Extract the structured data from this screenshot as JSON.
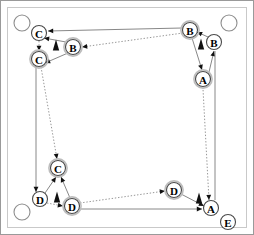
{
  "figure": {
    "width": 254,
    "height": 235,
    "background_color": "#ffffff",
    "frame": {
      "outer_color": "#9a9a9a",
      "inner_color": "#c9c9c9"
    }
  },
  "colors": {
    "node_stroke": "#4a4a4a",
    "node_halo": "#bdbdbd",
    "node_fill": "#ffffff",
    "corner_stroke": "#8d8d8d",
    "edge_solid": "#888888",
    "edge_dotted": "#8a8a8a",
    "arrow_fill": "#111111",
    "marker_fill": "#111111"
  },
  "corner_markers": [
    {
      "name": "corner-top-left",
      "label": "",
      "cx": 22,
      "cy": 23,
      "r": 8
    },
    {
      "name": "corner-top-right",
      "label": "",
      "cx": 229,
      "cy": 23,
      "r": 8
    },
    {
      "name": "corner-bottom-left",
      "label": "",
      "cx": 22,
      "cy": 212,
      "r": 8
    }
  ],
  "nodes": [
    {
      "id": "c-top",
      "label": "C",
      "cx": 39,
      "cy": 33,
      "r": 7.5,
      "halo": false
    },
    {
      "id": "b-top-inner",
      "label": "B",
      "cx": 73,
      "cy": 47,
      "r": 7.5,
      "halo": true
    },
    {
      "id": "c-upper-left",
      "label": "C",
      "cx": 39,
      "cy": 59,
      "r": 7.5,
      "halo": true
    },
    {
      "id": "b-top-right",
      "label": "B",
      "cx": 190,
      "cy": 30,
      "r": 7.5,
      "halo": true
    },
    {
      "id": "b-right",
      "label": "B",
      "cx": 214,
      "cy": 42,
      "r": 7.5,
      "halo": false
    },
    {
      "id": "a-right",
      "label": "A",
      "cx": 203,
      "cy": 79,
      "r": 7.5,
      "halo": true
    },
    {
      "id": "c-lower-left",
      "label": "C",
      "cx": 58,
      "cy": 168,
      "r": 7.5,
      "halo": true
    },
    {
      "id": "d-left",
      "label": "D",
      "cx": 40,
      "cy": 199,
      "r": 7.5,
      "halo": false
    },
    {
      "id": "d-inner",
      "label": "D",
      "cx": 72,
      "cy": 206,
      "r": 7.5,
      "halo": true
    },
    {
      "id": "d-right",
      "label": "D",
      "cx": 174,
      "cy": 190,
      "r": 7.5,
      "halo": true
    },
    {
      "id": "a-bottom",
      "label": "A",
      "cx": 211,
      "cy": 208,
      "r": 7.5,
      "halo": false
    },
    {
      "id": "e-bottom",
      "label": "E",
      "cx": 228,
      "cy": 222,
      "r": 7.5,
      "halo": false
    }
  ],
  "orientation_markers": [
    {
      "name": "marker-top-left",
      "cx": 56,
      "cy": 45,
      "size": 11,
      "rotation": 0
    },
    {
      "name": "marker-top-right",
      "cx": 201,
      "cy": 44,
      "size": 11,
      "rotation": 0
    },
    {
      "name": "marker-bottom-left",
      "cx": 57,
      "cy": 197,
      "size": 11,
      "rotation": 0
    },
    {
      "name": "marker-bottom-right",
      "cx": 199,
      "cy": 198,
      "size": 11,
      "rotation": 0
    }
  ],
  "edges": [
    {
      "name": "edge-b-top-right-to-c-top",
      "style": "solid",
      "from": "b-top-right",
      "to": "c-top",
      "x1": 182,
      "y1": 28,
      "x2": 48,
      "y2": 31,
      "arrow": "end"
    },
    {
      "name": "edge-b-right-to-b-top-right",
      "style": "solid",
      "from": "b-right",
      "to": "b-top-right",
      "x1": 208,
      "y1": 37,
      "x2": 197,
      "y2": 32,
      "arrow": "end"
    },
    {
      "name": "edge-b-top-right-to-a-right",
      "style": "solid",
      "from": "b-top-right",
      "to": "a-right",
      "x1": 192,
      "y1": 38,
      "x2": 202,
      "y2": 70,
      "arrow": "end"
    },
    {
      "name": "edge-a-right-to-b-right",
      "style": "solid",
      "from": "a-right",
      "to": "b-right",
      "x1": 209,
      "y1": 72,
      "x2": 214,
      "y2": 51,
      "arrow": "end"
    },
    {
      "name": "edge-b-inner-to-c-top",
      "style": "solid",
      "from": "b-top-inner",
      "to": "c-top",
      "x1": 66,
      "y1": 42,
      "x2": 44,
      "y2": 38,
      "arrow": "end"
    },
    {
      "name": "edge-b-top-right-to-b-inner",
      "style": "dotted",
      "from": "b-top-right",
      "to": "b-top-inner",
      "x1": 183,
      "y1": 33,
      "x2": 82,
      "y2": 47,
      "arrow": "end"
    },
    {
      "name": "edge-c-top-to-c-upper-left",
      "style": "dotted",
      "from": "c-top",
      "to": "c-upper-left",
      "x1": 39,
      "y1": 41,
      "x2": 39,
      "y2": 51,
      "arrow": "end"
    },
    {
      "name": "edge-b-inner-to-c-upper-left",
      "style": "solid",
      "from": "b-top-inner",
      "to": "c-upper-left",
      "x1": 68,
      "y1": 53,
      "x2": 45,
      "y2": 63,
      "arrow": "end"
    },
    {
      "name": "edge-c-upper-left-to-c-lower-left",
      "style": "dotted",
      "from": "c-upper-left",
      "to": "c-lower-left",
      "x1": 41,
      "y1": 67,
      "x2": 57,
      "y2": 159,
      "arrow": "end"
    },
    {
      "name": "edge-left-rail-to-d-left",
      "style": "solid",
      "from": "c-upper-left",
      "to": "d-left",
      "x1": 36,
      "y1": 63,
      "x2": 36,
      "y2": 192,
      "arrow": "end"
    },
    {
      "name": "edge-d-left-to-c-lower-left",
      "style": "solid",
      "from": "d-left",
      "to": "c-lower-left",
      "x1": 45,
      "y1": 193,
      "x2": 56,
      "y2": 177,
      "arrow": "end"
    },
    {
      "name": "edge-d-inner-to-c-lower-left",
      "style": "solid",
      "from": "d-inner",
      "to": "c-lower-left",
      "x1": 70,
      "y1": 198,
      "x2": 61,
      "y2": 177,
      "arrow": "end"
    },
    {
      "name": "edge-d-left-to-d-inner",
      "style": "dotted",
      "from": "d-left",
      "to": "d-inner",
      "x1": 47,
      "y1": 203,
      "x2": 63,
      "y2": 206,
      "arrow": "end"
    },
    {
      "name": "edge-d-inner-to-d-right",
      "style": "dotted",
      "from": "d-inner",
      "to": "d-right",
      "x1": 80,
      "y1": 203,
      "x2": 165,
      "y2": 191,
      "arrow": "end"
    },
    {
      "name": "edge-d-inner-to-a-bottom",
      "style": "solid",
      "from": "d-inner",
      "to": "a-bottom",
      "x1": 79,
      "y1": 209,
      "x2": 202,
      "y2": 209,
      "arrow": "end"
    },
    {
      "name": "edge-d-right-to-a-bottom",
      "style": "solid",
      "from": "d-right",
      "to": "a-bottom",
      "x1": 181,
      "y1": 194,
      "x2": 204,
      "y2": 206,
      "arrow": "end"
    },
    {
      "name": "edge-a-right-to-a-bottom",
      "style": "dotted",
      "from": "a-bottom",
      "to": "a-right",
      "x1": 209,
      "y1": 200,
      "x2": 203,
      "y2": 89,
      "arrow": "start"
    },
    {
      "name": "edge-right-rail",
      "style": "solid",
      "from": "a-bottom",
      "to": "b-right",
      "x1": 215,
      "y1": 200,
      "x2": 215,
      "y2": 51,
      "arrow": "none"
    }
  ],
  "legend": {
    "node_letters": [
      "A",
      "B",
      "C",
      "D",
      "E"
    ],
    "edge_styles": [
      "solid",
      "dotted"
    ]
  }
}
